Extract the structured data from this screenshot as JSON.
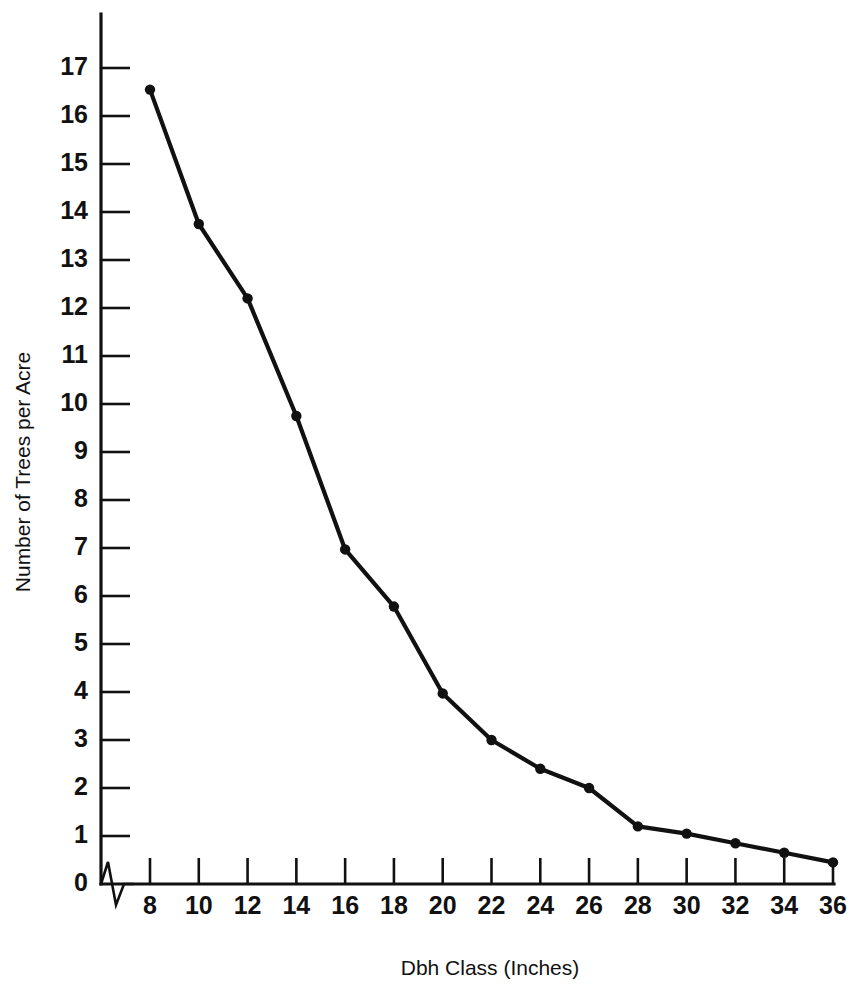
{
  "chart_data": {
    "type": "line",
    "title": "",
    "xlabel": "Dbh Class (Inches)",
    "ylabel": "Number of Trees per Acre",
    "x": [
      8,
      10,
      12,
      14,
      16,
      18,
      20,
      22,
      24,
      26,
      28,
      30,
      32,
      34,
      36
    ],
    "values": [
      16.55,
      13.75,
      12.2,
      9.75,
      6.97,
      5.78,
      3.97,
      3.0,
      2.4,
      2.0,
      1.2,
      1.05,
      0.85,
      0.65,
      0.45
    ],
    "series": [
      {
        "name": "Number of Trees per Acre",
        "values": [
          16.55,
          13.75,
          12.2,
          9.75,
          6.97,
          5.78,
          3.97,
          3.0,
          2.4,
          2.0,
          1.2,
          1.05,
          0.85,
          0.65,
          0.45
        ]
      }
    ],
    "xlim": [
      8,
      36
    ],
    "ylim": [
      0,
      17
    ],
    "xticks": [
      8,
      10,
      12,
      14,
      16,
      18,
      20,
      22,
      24,
      26,
      28,
      30,
      32,
      34,
      36
    ],
    "xtick_labels": [
      "8",
      "10",
      "12",
      "14",
      "16",
      "18",
      "20",
      "22",
      "24",
      "26",
      "28",
      "30",
      "32",
      "34",
      "36"
    ],
    "yticks": [
      0,
      1,
      2,
      3,
      4,
      5,
      6,
      7,
      8,
      9,
      10,
      11,
      12,
      13,
      14,
      15,
      16,
      17
    ],
    "ytick_labels": [
      "0",
      "1",
      "2",
      "3",
      "4",
      "5",
      "6",
      "7",
      "8",
      "9",
      "10",
      "11",
      "12",
      "13",
      "14",
      "15",
      "16",
      "17"
    ],
    "grid": false,
    "legend": false,
    "legend_position": "none",
    "markers": "filled-circle",
    "line_color": "#111111",
    "marker_color": "#111111",
    "background_color": "#ffffff",
    "axis_break": true,
    "axis_break_note": "zigzag break on x-axis between origin and first category"
  }
}
